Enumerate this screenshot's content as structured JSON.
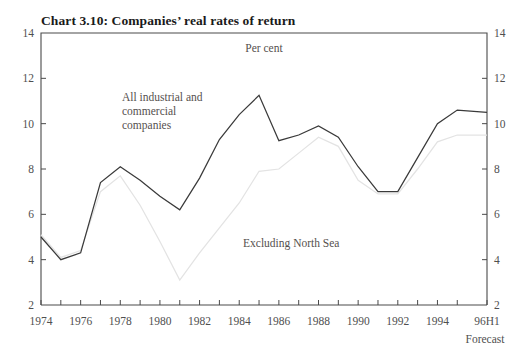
{
  "chart_data": {
    "type": "line",
    "title": "Chart 3.10: Companies’ real rates of return",
    "unit_label": "Per cent",
    "xlabel": "",
    "ylabel": "",
    "forecast_note": "Forecast",
    "grid": false,
    "legend_position": "inline-annotations",
    "ylim": [
      2,
      14
    ],
    "yticks": [
      2,
      4,
      6,
      8,
      10,
      12,
      14
    ],
    "ytick_labels": [
      "2",
      "4",
      "6",
      "8",
      "10",
      "12",
      "14"
    ],
    "y_axis_right_mirrored": true,
    "xlim": [
      1974,
      1996.5
    ],
    "x": [
      1974,
      1975,
      1976,
      1977,
      1978,
      1979,
      1980,
      1981,
      1982,
      1983,
      1984,
      1985,
      1986,
      1987,
      1988,
      1989,
      1990,
      1991,
      1992,
      1993,
      1994,
      1995,
      1996.5
    ],
    "xticks": [
      1974,
      1975,
      1976,
      1977,
      1978,
      1979,
      1980,
      1981,
      1982,
      1983,
      1984,
      1985,
      1986,
      1987,
      1988,
      1989,
      1990,
      1991,
      1992,
      1993,
      1994,
      1995,
      1996.5
    ],
    "xtick_labels_shown": [
      {
        "x": 1974,
        "label": "1974"
      },
      {
        "x": 1976,
        "label": "1976"
      },
      {
        "x": 1978,
        "label": "1978"
      },
      {
        "x": 1980,
        "label": "1980"
      },
      {
        "x": 1982,
        "label": "1982"
      },
      {
        "x": 1984,
        "label": "1984"
      },
      {
        "x": 1986,
        "label": "1986"
      },
      {
        "x": 1988,
        "label": "1988"
      },
      {
        "x": 1990,
        "label": "1990"
      },
      {
        "x": 1992,
        "label": "1992"
      },
      {
        "x": 1994,
        "label": "1994"
      },
      {
        "x": 1996.5,
        "label": "96H1"
      }
    ],
    "series": [
      {
        "name": "All industrial and commercial companies",
        "color": "#3a3a3a",
        "values": [
          5.0,
          4.0,
          4.3,
          7.4,
          8.1,
          7.5,
          6.8,
          6.2,
          7.6,
          9.3,
          10.4,
          11.25,
          9.25,
          9.5,
          9.9,
          9.4,
          8.1,
          7.0,
          7.0,
          8.5,
          10.0,
          10.6,
          10.5
        ]
      },
      {
        "name": "Excluding North Sea",
        "color": "#e3e3e3",
        "values": [
          5.1,
          4.1,
          4.4,
          7.0,
          7.7,
          6.4,
          4.8,
          3.1,
          4.3,
          5.4,
          6.5,
          7.9,
          8.0,
          8.7,
          9.4,
          9.0,
          7.5,
          6.9,
          6.9,
          8.0,
          9.2,
          9.5,
          9.5
        ]
      }
    ],
    "annotations": [
      {
        "name": "all-companies-annotation",
        "lines": [
          "All industrial and",
          "commercial",
          "companies"
        ],
        "x": 122,
        "y": 101
      },
      {
        "name": "excluding-north-sea-annotation",
        "lines": [
          "Excluding North Sea"
        ],
        "x": 243,
        "y": 247
      }
    ]
  },
  "plot_geometry": {
    "left": 41,
    "right": 487,
    "top": 33,
    "bottom": 305
  }
}
